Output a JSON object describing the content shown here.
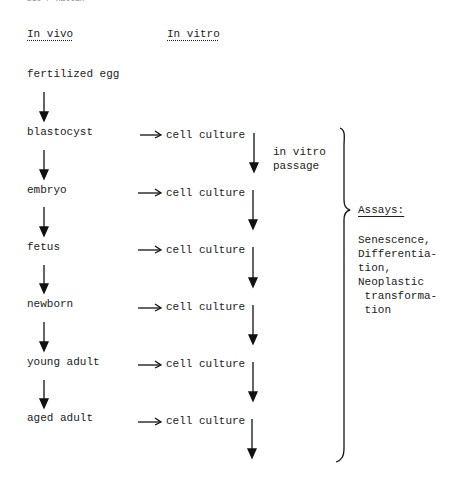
{
  "running_header": "210 / Rattan",
  "columns": {
    "in_vivo": "In vivo",
    "in_vitro": "In vitro"
  },
  "stages": [
    {
      "label": "fertilized egg",
      "culture": null
    },
    {
      "label": "blastocyst",
      "culture": "cell culture"
    },
    {
      "label": "embryo",
      "culture": "cell culture"
    },
    {
      "label": "fetus",
      "culture": "cell culture"
    },
    {
      "label": "newborn",
      "culture": "cell culture"
    },
    {
      "label": "young adult",
      "culture": "cell culture"
    },
    {
      "label": "aged adult",
      "culture": "cell culture"
    }
  ],
  "passage_label": "in vitro\npassage",
  "assays": {
    "heading": "Assays:",
    "items": "Senescence,\nDifferentia-\ntion,\nNeoplastic\n transforma-\n tion"
  }
}
